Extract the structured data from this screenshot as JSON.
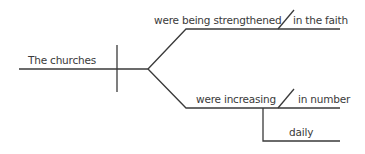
{
  "diagram": {
    "type": "sentence-diagram",
    "subject": "The churches",
    "predicates": [
      {
        "verb": "were being strengthened",
        "modifier": "in the faith"
      },
      {
        "verb": "were increasing",
        "modifier": "in number",
        "adverb": "daily"
      }
    ],
    "line_color": "#3a3a3a",
    "text_color": "#3a3a3a"
  }
}
